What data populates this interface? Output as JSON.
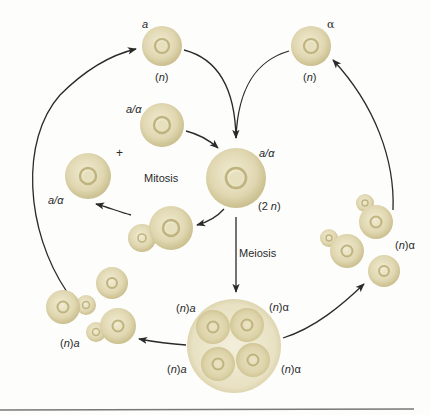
{
  "figure": {
    "colors": {
      "cell_fill_center": "#ece6c8",
      "cell_fill_edge": "#c9bd8c",
      "nucleus_ring": "#b9ad7c",
      "arrow": "#2a2a2a",
      "rule": "#777777"
    }
  },
  "labels": {
    "haploid_a_type": "a",
    "haploid_a_ploidy": "(n)",
    "haploid_alpha_type": "α",
    "haploid_alpha_ploidy": "(n)",
    "mitotic_diploid_type": "a/α",
    "plus_sign": "+",
    "mitosis": "Mitosis",
    "diploid_type": "a/α",
    "diploid_ploidy": "(2 n)",
    "left_diploid_type": "a/α",
    "meiosis": "Meiosis",
    "ascus_top_left": "(n)a",
    "ascus_top_right": "(n)α",
    "ascus_bottom_left": "(n)a",
    "ascus_bottom_right": "(n)α",
    "cluster_a": "(n)a",
    "cluster_alpha": "(n)α"
  },
  "nodes": [
    {
      "id": "haploid-a",
      "label": "a",
      "ploidy": "n"
    },
    {
      "id": "haploid-alpha",
      "label": "α",
      "ploidy": "n"
    },
    {
      "id": "diploid",
      "label": "a/α",
      "ploidy": "2n"
    },
    {
      "id": "ascus",
      "label": "4 spores: (n)a, (n)a, (n)α, (n)α"
    },
    {
      "id": "cluster-a",
      "label": "(n)a"
    },
    {
      "id": "cluster-alpha",
      "label": "(n)α"
    }
  ],
  "edges": [
    {
      "from": "haploid-a",
      "to": "diploid"
    },
    {
      "from": "haploid-alpha",
      "to": "diploid"
    },
    {
      "from": "diploid",
      "to": "ascus",
      "label": "Meiosis"
    },
    {
      "from": "ascus",
      "to": "cluster-a"
    },
    {
      "from": "ascus",
      "to": "cluster-alpha"
    },
    {
      "from": "cluster-a",
      "to": "haploid-a"
    },
    {
      "from": "cluster-alpha",
      "to": "haploid-alpha"
    },
    {
      "from": "diploid",
      "to": "diploid",
      "label": "Mitosis"
    }
  ]
}
